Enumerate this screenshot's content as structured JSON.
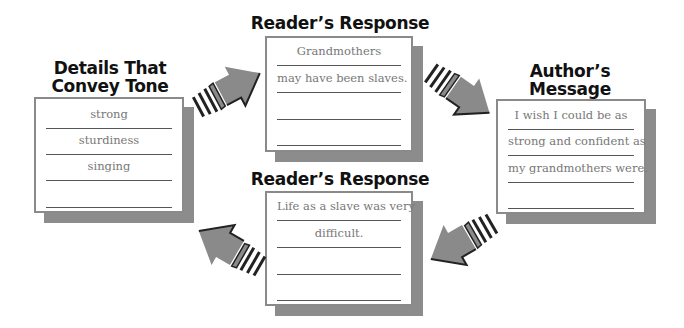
{
  "panels": {
    "details": {
      "title_line1": "Details That",
      "title_line2": "Convey Tone",
      "lines": [
        "strong",
        "sturdiness",
        "singing",
        ""
      ]
    },
    "reader_top": {
      "title": "Reader’s Response",
      "lines": [
        "Grandmothers",
        "may have been slaves.",
        "",
        ""
      ]
    },
    "author": {
      "title_line1": "Author’s",
      "title_line2": "Message",
      "lines": [
        "I wish I could be as",
        "strong and confident as",
        "my grandmothers were.",
        ""
      ]
    },
    "reader_bottom": {
      "title": "Reader’s Response",
      "lines": [
        "Life as a slave was very",
        "difficult.",
        "",
        ""
      ]
    }
  },
  "colors": {
    "arrow_fill": "#8a8a8a",
    "shadow": "#8c8c8c",
    "border": "#8a8a8a",
    "text": "#777777",
    "title": "#111111"
  },
  "arrows": [
    {
      "name": "arrow-details-to-reader-top",
      "direction": "up-right"
    },
    {
      "name": "arrow-reader-top-to-author",
      "direction": "down-right"
    },
    {
      "name": "arrow-author-to-reader-bottom",
      "direction": "down-left"
    },
    {
      "name": "arrow-reader-bottom-to-details",
      "direction": "up-left"
    }
  ]
}
